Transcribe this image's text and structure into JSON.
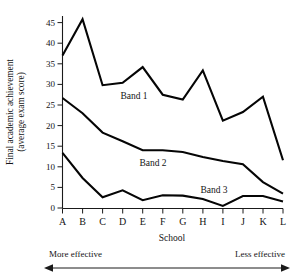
{
  "chart_data": {
    "type": "line",
    "title": "",
    "xlabel": "School",
    "ylabel": "Final academic achievement (average exam score)",
    "ylabel_line1": "Final academic achievement",
    "ylabel_line2": "(average exam score)",
    "categories": [
      "A",
      "B",
      "C",
      "D",
      "E",
      "F",
      "G",
      "H",
      "I",
      "J",
      "K",
      "L"
    ],
    "ylim": [
      0,
      47
    ],
    "yticks": [
      0,
      5,
      10,
      15,
      20,
      25,
      30,
      35,
      40,
      45
    ],
    "ytick_labels": [
      "0",
      "5",
      "10",
      "15",
      "20",
      "25",
      "30",
      "35",
      "40",
      "45"
    ],
    "grid": false,
    "legend_position": "inline-labels",
    "series": [
      {
        "name": "Band 1",
        "label": "Band 1",
        "color": "#050505",
        "values": [
          37.0,
          45.8,
          29.8,
          30.4,
          34.2,
          27.5,
          26.3,
          33.4,
          21.2,
          23.3,
          27.0,
          11.6
        ]
      },
      {
        "name": "Band 2",
        "label": "Band 2",
        "color": "#050505",
        "values": [
          26.7,
          23.0,
          18.3,
          16.2,
          14.0,
          14.0,
          13.6,
          12.4,
          11.4,
          10.6,
          6.3,
          3.5
        ]
      },
      {
        "name": "Band 3",
        "label": "Band 3",
        "color": "#050505",
        "values": [
          13.4,
          7.3,
          2.6,
          4.3,
          1.9,
          3.1,
          3.0,
          2.2,
          0.5,
          2.9,
          2.9,
          1.6
        ]
      }
    ],
    "annotations": [
      {
        "name": "more-effective",
        "text": "More effective",
        "position": "bottom-left"
      },
      {
        "name": "less-effective",
        "text": "Less effective",
        "position": "bottom-right"
      }
    ],
    "arrow": {
      "name": "effectiveness-arrow",
      "double_headed": true
    }
  }
}
